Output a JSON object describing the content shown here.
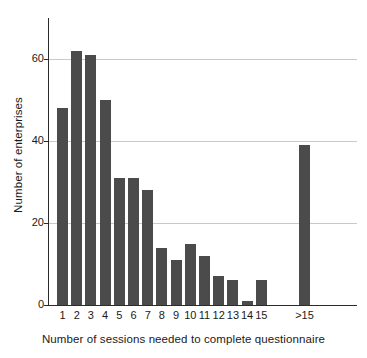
{
  "chart_data": {
    "type": "bar",
    "title": "",
    "subtitle": "",
    "xlabel": "Number of sessions needed to complete questionnaire",
    "ylabel": "Number of enterprises",
    "categories": [
      "1",
      "2",
      "3",
      "4",
      "5",
      "6",
      "7",
      "8",
      "9",
      "10",
      "11",
      "12",
      "13",
      "14",
      "15",
      ">15"
    ],
    "values": [
      48,
      62,
      61,
      50,
      31,
      31,
      28,
      14,
      11,
      15,
      12,
      7,
      6,
      1,
      6,
      39
    ],
    "series": [
      {
        "name": "Number of enterprises",
        "values": [
          48,
          62,
          61,
          50,
          31,
          31,
          28,
          14,
          11,
          15,
          12,
          7,
          6,
          1,
          6,
          39
        ]
      }
    ],
    "ylim": [
      0,
      70
    ],
    "ytick_labels": [
      "0",
      "20",
      "40",
      "60"
    ],
    "ytick_values": [
      0,
      20,
      40,
      60
    ],
    "grid": "horizontal",
    "legend": "none",
    "bar_color": "#4b4b4b",
    "gridline_color": "#c9c9c9",
    "axis_color": "#2b2b2b",
    "background_color": "#ffffff",
    "annotations": []
  }
}
